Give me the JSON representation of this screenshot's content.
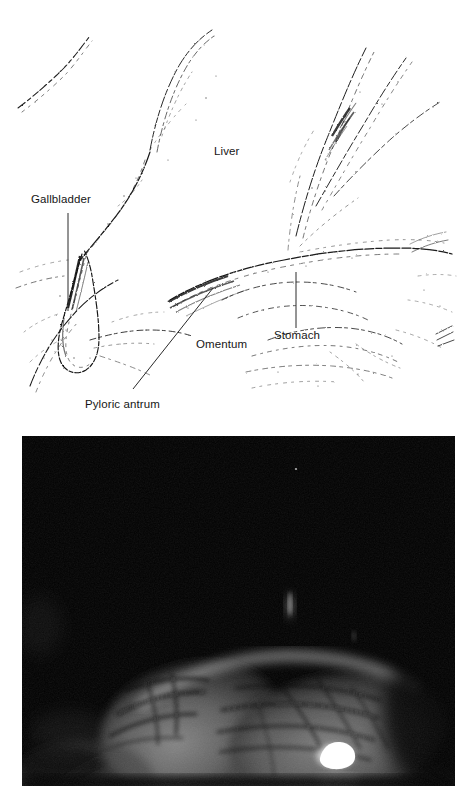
{
  "figure": {
    "type": "two-panel anatomical figure",
    "panels": [
      {
        "id": "drawing",
        "kind": "line-drawing-schematic"
      },
      {
        "id": "photo",
        "kind": "laparoscopic-photograph"
      }
    ]
  },
  "drawing": {
    "style": "stippled pen-and-ink line drawing",
    "background_color": "#ffffff",
    "ink_color": "#1a1a1a",
    "labels": [
      {
        "key": "liver",
        "text": "Liver",
        "x": 214,
        "y": 146,
        "leader": "none"
      },
      {
        "key": "gallbladder",
        "text": "Gallbladder",
        "x": 31,
        "y": 194,
        "leader": "vertical"
      },
      {
        "key": "omentum",
        "text": "Omentum",
        "x": 196,
        "y": 339,
        "leader": "none"
      },
      {
        "key": "stomach",
        "text": "Stomach",
        "x": 274,
        "y": 330,
        "leader": "vertical"
      },
      {
        "key": "pyloric_antrum",
        "text": "Pyloric antrum",
        "x": 85,
        "y": 399,
        "leader": "diagonal"
      }
    ],
    "leader_lines": [
      {
        "key": "gallbladder-leader",
        "x1": 68,
        "y1": 213,
        "x2": 68,
        "y2": 311
      },
      {
        "key": "stomach-leader",
        "x1": 296,
        "y1": 272,
        "x2": 296,
        "y2": 328
      },
      {
        "key": "pyloric-leader",
        "x1": 133,
        "y1": 389,
        "x2": 213,
        "y2": 288
      }
    ]
  },
  "photo": {
    "description": "dark laparoscopic view of abdominal organ surface",
    "frame_color": "#000000",
    "border_color": "#ffffff",
    "tissue_color": "#6a6a6a",
    "highlight_color": "#ffffff",
    "specular_highlight": {
      "x": 335,
      "y": 752,
      "label": "specular-highlight"
    },
    "faint_streak": {
      "x": 290,
      "y": 605,
      "label": "faint-light-streak"
    },
    "speck": {
      "x": 296,
      "y": 466,
      "label": "bright-speck"
    }
  }
}
